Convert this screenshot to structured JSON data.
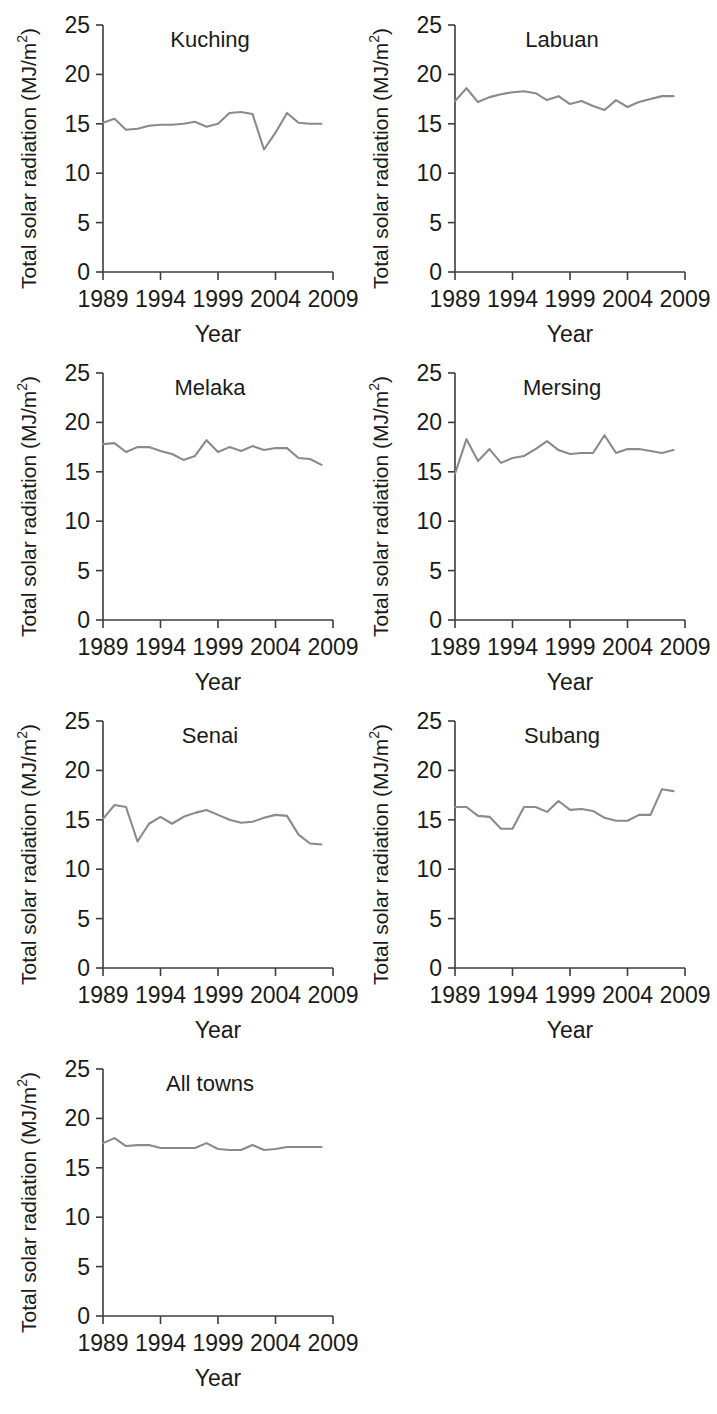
{
  "figure": {
    "background_color": "#ffffff",
    "line_color": "#8a8a8a",
    "axis_color": "#3c3c3c",
    "text_color": "#1a1a1a",
    "axis_label_y": "Total solar radiation (MJ/m",
    "axis_label_y_sup": "2",
    "axis_label_y_close": ")",
    "axis_label_x": "Year",
    "y_ticks": [
      "0",
      "5",
      "10",
      "15",
      "20",
      "25"
    ],
    "x_ticks": [
      "1989",
      "1994",
      "1999",
      "2004",
      "2009"
    ]
  },
  "chart_data": [
    {
      "type": "line",
      "title": "Kuching",
      "xlabel": "Year",
      "ylabel": "Total solar radiation (MJ/m2)",
      "xlim": [
        1989,
        2009
      ],
      "ylim": [
        0,
        25
      ],
      "yticks": [
        0,
        5,
        10,
        15,
        20,
        25
      ],
      "xticks": [
        1989,
        1994,
        1999,
        2004,
        2009
      ],
      "grid": false,
      "legend": "none",
      "x": [
        1989,
        1990,
        1991,
        1992,
        1993,
        1994,
        1995,
        1996,
        1997,
        1998,
        1999,
        2000,
        2001,
        2002,
        2003,
        2004,
        2005,
        2006,
        2007,
        2008
      ],
      "values": [
        15.1,
        15.5,
        14.4,
        14.5,
        14.8,
        14.9,
        14.9,
        15.0,
        15.2,
        14.7,
        15.0,
        16.1,
        16.2,
        16.0,
        12.4,
        14.1,
        16.1,
        15.1,
        15.0,
        15.0
      ]
    },
    {
      "type": "line",
      "title": "Labuan",
      "xlabel": "Year",
      "ylabel": "Total solar radiation (MJ/m2)",
      "xlim": [
        1989,
        2009
      ],
      "ylim": [
        0,
        25
      ],
      "yticks": [
        0,
        5,
        10,
        15,
        20,
        25
      ],
      "xticks": [
        1989,
        1994,
        1999,
        2004,
        2009
      ],
      "grid": false,
      "legend": "none",
      "x": [
        1989,
        1990,
        1991,
        1992,
        1993,
        1994,
        1995,
        1996,
        1997,
        1998,
        1999,
        2000,
        2001,
        2002,
        2003,
        2004,
        2005,
        2006,
        2007,
        2008
      ],
      "values": [
        17.3,
        18.6,
        17.2,
        17.7,
        18.0,
        18.2,
        18.3,
        18.1,
        17.4,
        17.8,
        17.0,
        17.3,
        16.8,
        16.4,
        17.4,
        16.7,
        17.2,
        17.5,
        17.8,
        17.8
      ]
    },
    {
      "type": "line",
      "title": "Melaka",
      "xlabel": "Year",
      "ylabel": "Total solar radiation (MJ/m2)",
      "xlim": [
        1989,
        2009
      ],
      "ylim": [
        0,
        25
      ],
      "yticks": [
        0,
        5,
        10,
        15,
        20,
        25
      ],
      "xticks": [
        1989,
        1994,
        1999,
        2004,
        2009
      ],
      "grid": false,
      "legend": "none",
      "x": [
        1989,
        1990,
        1991,
        1992,
        1993,
        1994,
        1995,
        1996,
        1997,
        1998,
        1999,
        2000,
        2001,
        2002,
        2003,
        2004,
        2005,
        2006,
        2007,
        2008
      ],
      "values": [
        17.8,
        17.9,
        17.0,
        17.5,
        17.5,
        17.1,
        16.8,
        16.2,
        16.6,
        18.2,
        17.0,
        17.5,
        17.1,
        17.6,
        17.2,
        17.4,
        17.4,
        16.4,
        16.3,
        15.7
      ]
    },
    {
      "type": "line",
      "title": "Mersing",
      "xlabel": "Year",
      "ylabel": "Total solar radiation (MJ/m2)",
      "xlim": [
        1989,
        2009
      ],
      "ylim": [
        0,
        25
      ],
      "yticks": [
        0,
        5,
        10,
        15,
        20,
        25
      ],
      "xticks": [
        1989,
        1994,
        1999,
        2004,
        2009
      ],
      "grid": false,
      "legend": "none",
      "x": [
        1989,
        1990,
        1991,
        1992,
        1993,
        1994,
        1995,
        1996,
        1997,
        1998,
        1999,
        2000,
        2001,
        2002,
        2003,
        2004,
        2005,
        2006,
        2007,
        2008
      ],
      "values": [
        14.8,
        18.3,
        16.1,
        17.3,
        15.9,
        16.4,
        16.6,
        17.3,
        18.1,
        17.2,
        16.8,
        16.9,
        16.9,
        18.7,
        16.9,
        17.3,
        17.3,
        17.1,
        16.9,
        17.2
      ]
    },
    {
      "type": "line",
      "title": "Senai",
      "xlabel": "Year",
      "ylabel": "Total solar radiation (MJ/m2)",
      "xlim": [
        1989,
        2009
      ],
      "ylim": [
        0,
        25
      ],
      "yticks": [
        0,
        5,
        10,
        15,
        20,
        25
      ],
      "xticks": [
        1989,
        1994,
        1999,
        2004,
        2009
      ],
      "grid": false,
      "legend": "none",
      "x": [
        1989,
        1990,
        1991,
        1992,
        1993,
        1994,
        1995,
        1996,
        1997,
        1998,
        1999,
        2000,
        2001,
        2002,
        2003,
        2004,
        2005,
        2006,
        2007,
        2008
      ],
      "values": [
        15.1,
        16.5,
        16.3,
        12.8,
        14.6,
        15.3,
        14.6,
        15.3,
        15.7,
        16.0,
        15.5,
        15.0,
        14.7,
        14.8,
        15.2,
        15.5,
        15.4,
        13.5,
        12.6,
        12.5
      ]
    },
    {
      "type": "line",
      "title": "Subang",
      "xlabel": "Year",
      "ylabel": "Total solar radiation (MJ/m2)",
      "xlim": [
        1989,
        2009
      ],
      "ylim": [
        0,
        25
      ],
      "yticks": [
        0,
        5,
        10,
        15,
        20,
        25
      ],
      "xticks": [
        1989,
        1994,
        1999,
        2004,
        2009
      ],
      "grid": false,
      "legend": "none",
      "x": [
        1989,
        1990,
        1991,
        1992,
        1993,
        1994,
        1995,
        1996,
        1997,
        1998,
        1999,
        2000,
        2001,
        2002,
        2003,
        2004,
        2005,
        2006,
        2007,
        2008
      ],
      "values": [
        16.3,
        16.3,
        15.4,
        15.3,
        14.1,
        14.1,
        16.3,
        16.3,
        15.8,
        16.9,
        16.0,
        16.1,
        15.9,
        15.2,
        14.9,
        14.9,
        15.5,
        15.5,
        18.1,
        17.9
      ]
    },
    {
      "type": "line",
      "title": "All towns",
      "xlabel": "Year",
      "ylabel": "Total solar radiation (MJ/m2)",
      "xlim": [
        1989,
        2009
      ],
      "ylim": [
        0,
        25
      ],
      "yticks": [
        0,
        5,
        10,
        15,
        20,
        25
      ],
      "xticks": [
        1989,
        1994,
        1999,
        2004,
        2009
      ],
      "grid": false,
      "legend": "none",
      "x": [
        1989,
        1990,
        1991,
        1992,
        1993,
        1994,
        1995,
        1996,
        1997,
        1998,
        1999,
        2000,
        2001,
        2002,
        2003,
        2004,
        2005,
        2006,
        2007,
        2008
      ],
      "values": [
        17.5,
        18.0,
        17.2,
        17.3,
        17.3,
        17.0,
        17.0,
        17.0,
        17.0,
        17.5,
        16.9,
        16.8,
        16.8,
        17.3,
        16.8,
        16.9,
        17.1,
        17.1,
        17.1,
        17.1
      ]
    }
  ],
  "panels": [
    {
      "index": 0,
      "title": "Kuching",
      "col": 0,
      "row": 0
    },
    {
      "index": 1,
      "title": "Labuan",
      "col": 1,
      "row": 0
    },
    {
      "index": 2,
      "title": "Melaka",
      "col": 0,
      "row": 1
    },
    {
      "index": 3,
      "title": "Mersing",
      "col": 1,
      "row": 1
    },
    {
      "index": 4,
      "title": "Senai",
      "col": 0,
      "row": 2
    },
    {
      "index": 5,
      "title": "Subang",
      "col": 1,
      "row": 2
    },
    {
      "index": 6,
      "title": "All towns",
      "col": 0,
      "row": 3
    }
  ]
}
